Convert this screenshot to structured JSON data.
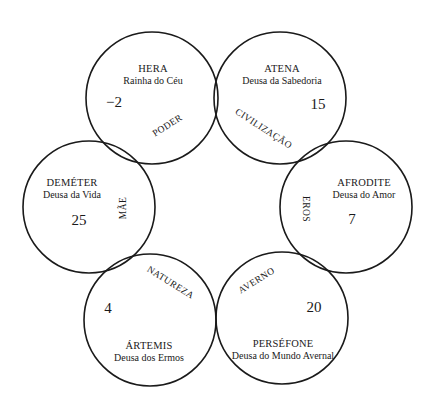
{
  "diagram": {
    "type": "six-circle overlapping ring diagram",
    "circles": [
      {
        "id": "hera",
        "name": "HERA",
        "subtitle": "Rainha do Céu",
        "value": "−2"
      },
      {
        "id": "atena",
        "name": "ATENA",
        "subtitle": "Deusa da Sabedoria",
        "value": "15"
      },
      {
        "id": "afrodite",
        "name": "AFRODITE",
        "subtitle": "Deusa do Amor",
        "value": "7"
      },
      {
        "id": "persefone",
        "name": "PERSÉFONE",
        "subtitle": "Deusa do Mundo Avernal",
        "value": "20"
      },
      {
        "id": "artemis",
        "name": "ÁRTEMIS",
        "subtitle": "Deusa dos Ermos",
        "value": "4"
      },
      {
        "id": "demeter",
        "name": "DEMÉTER",
        "subtitle": "Deusa da Vida",
        "value": "25"
      }
    ],
    "intersections": [
      {
        "between": [
          "hera",
          "demeter"
        ],
        "label": "PODER"
      },
      {
        "between": [
          "hera",
          "atena"
        ],
        "label": ""
      },
      {
        "between": [
          "atena",
          "afrodite"
        ],
        "label": "CIVILIZAÇÃO"
      },
      {
        "between": [
          "afrodite",
          "persefone"
        ],
        "label": "EROS"
      },
      {
        "between": [
          "persefone",
          "artemis"
        ],
        "label": "AVERNO"
      },
      {
        "between": [
          "artemis",
          "demeter"
        ],
        "label": "NATUREZA"
      },
      {
        "between": [
          "demeter",
          "hera"
        ],
        "label": "MÃE"
      }
    ],
    "lens_labels": {
      "poder": "PODER",
      "civilizacao": "CIVILIZAÇÃO",
      "eros": "EROS",
      "averno": "AVERNO",
      "natureza": "NATUREZA",
      "mae": "MÃE"
    },
    "colors": {
      "stroke": "#1a1a1a",
      "background": "#ffffff"
    }
  }
}
